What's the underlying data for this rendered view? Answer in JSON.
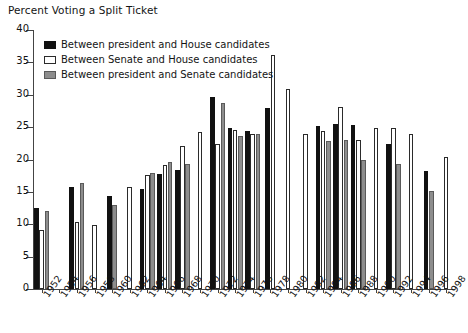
{
  "chart_data": {
    "type": "bar",
    "title": "Percent Voting a Split Ticket",
    "xlabel": "",
    "ylabel": "",
    "ylim": [
      0,
      40
    ],
    "yticks": [
      0,
      5,
      10,
      15,
      20,
      25,
      30,
      35,
      40
    ],
    "grid": false,
    "legend_position": "top-left",
    "categories": [
      "1952",
      "1954",
      "1956",
      "1958",
      "1960",
      "1962",
      "1964",
      "1966",
      "1968",
      "1970",
      "1972",
      "1974",
      "1976",
      "1978",
      "1980",
      "1982",
      "1984",
      "1986",
      "1988",
      "1990",
      "1992",
      "1994",
      "1996",
      "1998"
    ],
    "series": [
      {
        "name": "Between president and House candidates",
        "color": "#111111",
        "values": [
          12.5,
          null,
          15.8,
          null,
          14.4,
          null,
          15.4,
          17.8,
          18.4,
          null,
          29.6,
          24.8,
          24.4,
          27.9,
          null,
          null,
          25.1,
          25.5,
          25.3,
          null,
          22.4,
          null,
          18.2,
          null
        ]
      },
      {
        "name": "Between Senate and House candidates",
        "color": "#ffffff",
        "values": [
          9.1,
          null,
          10.3,
          9.9,
          null,
          15.7,
          17.6,
          19.1,
          22.1,
          24.3,
          22.4,
          24.5,
          23.9,
          36.1,
          30.9,
          24.0,
          24.4,
          28.1,
          23.0,
          24.8,
          24.9,
          23.9,
          null,
          20.4
        ]
      },
      {
        "name": "Between president and Senate candidates",
        "color": "#8d8d8d",
        "values": [
          12.0,
          null,
          16.3,
          null,
          13.0,
          null,
          17.9,
          19.6,
          19.3,
          null,
          28.8,
          23.6,
          23.9,
          null,
          null,
          null,
          22.8,
          23.0,
          19.9,
          null,
          19.3,
          null,
          15.1,
          null
        ]
      }
    ]
  },
  "legend": {
    "items": [
      {
        "swatch": "black",
        "label": "Between president and House candidates"
      },
      {
        "swatch": "white",
        "label": "Between Senate and House candidates"
      },
      {
        "swatch": "gray",
        "label": "Between president and Senate candidates"
      }
    ]
  }
}
